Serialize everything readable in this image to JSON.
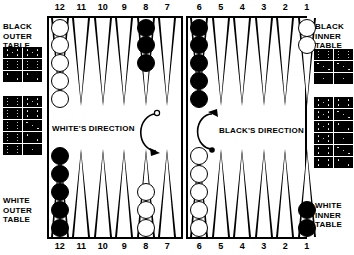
{
  "board": {
    "point_numbers_top": [
      "12",
      "11",
      "10",
      "9",
      "8",
      "7",
      "6",
      "5",
      "4",
      "3",
      "2",
      "1"
    ],
    "point_numbers_bottom": [
      "12",
      "11",
      "10",
      "9",
      "8",
      "7",
      "6",
      "5",
      "4",
      "3",
      "2",
      "1"
    ],
    "quadrant_labels": {
      "top_left": "BLACK\nOUTER\nTABLE",
      "top_right": "BLACK\nINNER\nTABLE",
      "bottom_left": "WHITE\nOUTER\nTABLE",
      "bottom_right": "WHITE\nINNER\nTABLE"
    },
    "directions": {
      "white": "WHITE'S DIRECTION",
      "black": "BLACK'S DIRECTION"
    },
    "colors": {
      "white_checker": "#ffffff",
      "black_checker": "#000000",
      "line": "#000000",
      "background": "#ffffff"
    },
    "checkers": [
      {
        "row": "top",
        "quadrant": "left",
        "point": "12",
        "color": "white",
        "count": 5
      },
      {
        "row": "top",
        "quadrant": "left",
        "point": "8",
        "color": "black",
        "count": 3
      },
      {
        "row": "top",
        "quadrant": "right",
        "point": "6",
        "color": "black",
        "count": 5
      },
      {
        "row": "top",
        "quadrant": "right",
        "point": "1",
        "color": "white",
        "count": 2
      },
      {
        "row": "bottom",
        "quadrant": "left",
        "point": "12",
        "color": "black",
        "count": 5
      },
      {
        "row": "bottom",
        "quadrant": "left",
        "point": "8",
        "color": "white",
        "count": 3
      },
      {
        "row": "bottom",
        "quadrant": "right",
        "point": "6",
        "color": "white",
        "count": 5
      },
      {
        "row": "bottom",
        "quadrant": "right",
        "point": "1",
        "color": "black",
        "count": 2
      }
    ]
  },
  "dice_panels": {
    "top_left": {
      "rows": [
        [
          5,
          5
        ],
        [
          6,
          6
        ],
        [
          2,
          2
        ]
      ]
    },
    "bottom_left": {
      "rows": [
        [
          6,
          5
        ],
        [
          6,
          4
        ],
        [
          6,
          3
        ],
        [
          6,
          2
        ],
        [
          6,
          1
        ]
      ]
    },
    "top_right": {
      "rows": [
        [
          6,
          6
        ],
        [
          3,
          3
        ],
        [
          1,
          1
        ]
      ]
    },
    "bottom_right": {
      "rows": [
        [
          5,
          4
        ],
        [
          5,
          3
        ],
        [
          5,
          2
        ],
        [
          5,
          1
        ],
        [
          4,
          3
        ],
        [
          4,
          2
        ]
      ]
    }
  }
}
